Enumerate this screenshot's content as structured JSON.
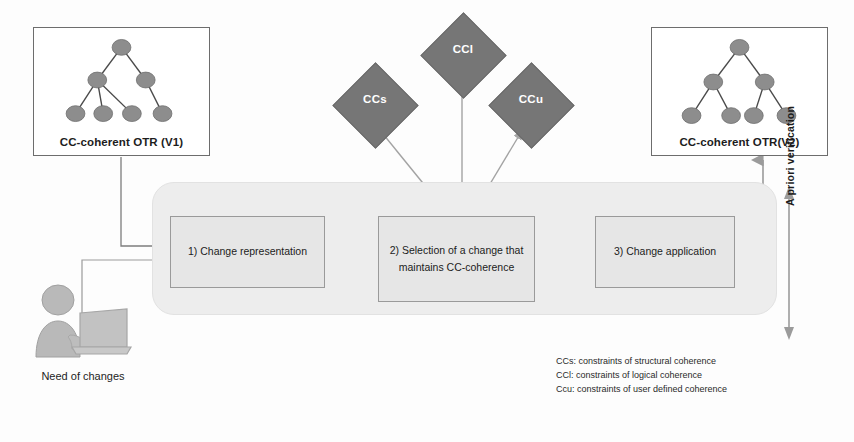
{
  "diagram": {
    "colors": {
      "diamond_fill": "#767676",
      "node_fill": "#8d8d8d",
      "container_fill": "#ededed",
      "box_fill": "#e6e6e6",
      "arrow": "#8a8a8a",
      "border": "#6d6d6d"
    }
  },
  "versions": {
    "v1": {
      "label": "CC-coherent OTR (V1)",
      "tree": {
        "name": "tree-v1",
        "nodes": [
          {
            "id": "r",
            "cx": 88.5,
            "cy": 15
          },
          {
            "id": "a",
            "cx": 64,
            "cy": 48
          },
          {
            "id": "b",
            "cx": 113,
            "cy": 48
          },
          {
            "id": "a1",
            "cx": 42,
            "cy": 82
          },
          {
            "id": "a2",
            "cx": 70,
            "cy": 82
          },
          {
            "id": "a3",
            "cx": 99,
            "cy": 82
          },
          {
            "id": "b1",
            "cx": 130,
            "cy": 82
          }
        ],
        "edges": [
          [
            "r",
            "a"
          ],
          [
            "r",
            "b"
          ],
          [
            "a",
            "a1"
          ],
          [
            "a",
            "a2"
          ],
          [
            "a",
            "a3"
          ],
          [
            "b",
            "b1"
          ]
        ]
      }
    },
    "v2": {
      "label": "CC-coherent OTR(V2)",
      "tree": {
        "name": "tree-v2",
        "nodes": [
          {
            "id": "r",
            "cx": 88.5,
            "cy": 15
          },
          {
            "id": "a",
            "cx": 62,
            "cy": 50
          },
          {
            "id": "b",
            "cx": 114,
            "cy": 50
          },
          {
            "id": "a1",
            "cx": 40,
            "cy": 84
          },
          {
            "id": "a2",
            "cx": 80,
            "cy": 84
          },
          {
            "id": "b1",
            "cx": 103,
            "cy": 84
          },
          {
            "id": "b2",
            "cx": 136,
            "cy": 84
          }
        ],
        "edges": [
          [
            "r",
            "a"
          ],
          [
            "r",
            "b"
          ],
          [
            "a",
            "a1"
          ],
          [
            "a",
            "a2"
          ],
          [
            "b",
            "b1"
          ],
          [
            "b",
            "b2"
          ]
        ]
      }
    }
  },
  "constraints": [
    {
      "id": "ccl",
      "label": "CCl"
    },
    {
      "id": "ccs",
      "label": "CCs"
    },
    {
      "id": "ccu",
      "label": "CCu"
    }
  ],
  "process": {
    "step1": "1) Change representation",
    "step2_line1": "2) Selection of a change that",
    "step2_line2": "maintains CC-coherence",
    "step3": "3) Change application"
  },
  "actor": {
    "label": "Need of changes"
  },
  "verification": {
    "label": "A priori verification"
  },
  "legend": [
    "CCs: constraints of structural coherence",
    "CCl: constraints of logical coherence",
    "Ccu: constraints of user defined coherence"
  ]
}
